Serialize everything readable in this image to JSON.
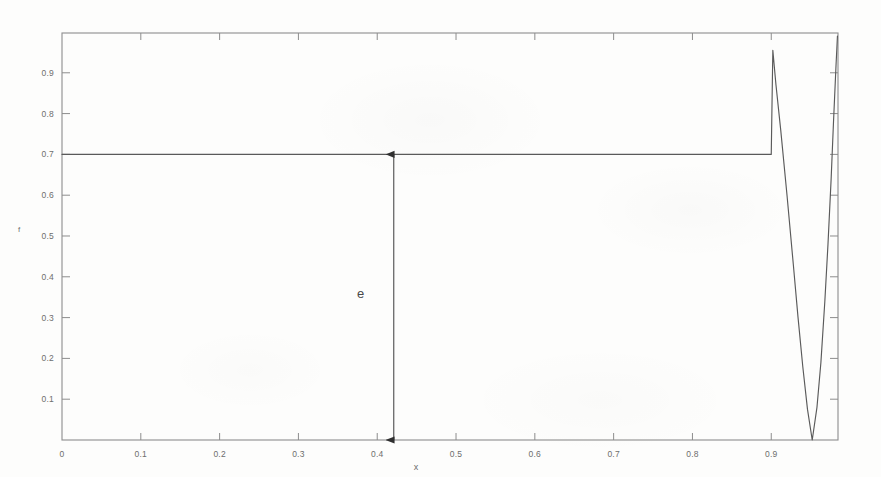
{
  "figure": {
    "background_color": "#fdfdfc",
    "line_color": "#5a5a5a",
    "axis_color": "#8a8a8a",
    "text_color": "#6d6d6d",
    "annotation_color": "#4a4a4a"
  },
  "chart_data": {
    "type": "line",
    "title": "",
    "subtitle": "",
    "xlabel": "x",
    "ylabel": "f",
    "xlim": [
      0,
      0.9847
    ],
    "ylim": [
      0,
      0.9975
    ],
    "grid": false,
    "legend": null,
    "x_ticks": [
      0,
      0.1,
      0.2,
      0.3,
      0.4,
      0.5,
      0.6,
      0.7,
      0.8,
      0.9
    ],
    "x_tick_labels": [
      "0",
      "0.1",
      "0.2",
      "0.3",
      "0.4",
      "0.5",
      "0.6",
      "0.7",
      "0.8",
      "0.9"
    ],
    "y_ticks": [
      0.1,
      0.2,
      0.3,
      0.4,
      0.5,
      0.6,
      0.7,
      0.8,
      0.9
    ],
    "y_tick_labels": [
      "0.1",
      "0.2",
      "0.3",
      "0.4",
      "0.5",
      "0.6",
      "0.7",
      "0.8",
      "0.9"
    ],
    "series": [
      {
        "name": "f(x)",
        "description": "Flat plateau at f = 0.7 from x = 0 to x = 0.9, then a sharp spike up to f = 0.955, a steep parabolic descent to f = 0 at x = 0.952, and a steep rise back to f = 0.99 at the right edge.",
        "x": [
          0.0,
          0.05,
          0.1,
          0.15,
          0.2,
          0.25,
          0.3,
          0.35,
          0.4,
          0.45,
          0.5,
          0.55,
          0.6,
          0.65,
          0.7,
          0.75,
          0.8,
          0.85,
          0.88,
          0.895,
          0.9,
          0.902,
          0.906,
          0.912,
          0.92,
          0.928,
          0.934,
          0.94,
          0.946,
          0.952,
          0.958,
          0.963,
          0.968,
          0.972,
          0.976,
          0.979,
          0.982,
          0.984
        ],
        "y": [
          0.7,
          0.7,
          0.7,
          0.7,
          0.7,
          0.7,
          0.7,
          0.7,
          0.7,
          0.7,
          0.7,
          0.7,
          0.7,
          0.7,
          0.7,
          0.7,
          0.7,
          0.7,
          0.7,
          0.7,
          0.7,
          0.955,
          0.87,
          0.76,
          0.6,
          0.43,
          0.3,
          0.18,
          0.075,
          0.0,
          0.08,
          0.19,
          0.34,
          0.48,
          0.64,
          0.78,
          0.91,
          0.99
        ]
      }
    ],
    "annotations": [
      {
        "name": "error-arrow",
        "label": "e",
        "type": "double-headed-vertical-arrow",
        "x": 0.421,
        "y_from": 0.0,
        "y_to": 0.7,
        "label_x": 0.392,
        "label_y": 0.355
      }
    ]
  }
}
